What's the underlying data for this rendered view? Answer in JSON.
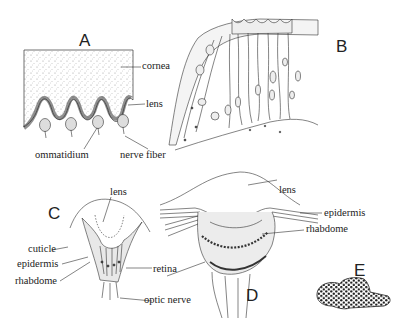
{
  "panels": {
    "A": {
      "letter": "A",
      "labels": {
        "cornea": "cornea",
        "lens": "lens",
        "ommatidium": "ommatidium",
        "nerve_fiber": "nerve fiber"
      }
    },
    "B": {
      "letter": "B"
    },
    "C": {
      "letter": "C",
      "labels": {
        "lens": "lens",
        "cuticle": "cuticle",
        "epidermis": "epidermis",
        "rhabdome": "rhabdome",
        "retina": "retina",
        "optic_nerve": "optic nerve"
      }
    },
    "D": {
      "letter": "D",
      "labels": {
        "lens": "lens",
        "epidermis": "epidermis",
        "rhabdome": "rhabdome"
      }
    },
    "E": {
      "letter": "E"
    }
  },
  "colors": {
    "ink": "#222222",
    "stipple": "#bdbdbd",
    "background": "#ffffff"
  }
}
